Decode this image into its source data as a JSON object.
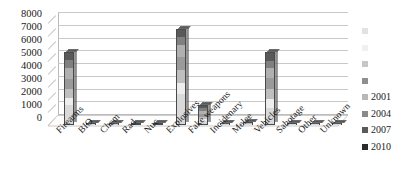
{
  "chart_data": {
    "type": "bar",
    "subtype": "stacked-3d-column",
    "title": "",
    "subtitle": "",
    "xlabel": "",
    "ylabel": "",
    "ylim": [
      0,
      8000
    ],
    "ytick_step": 1000,
    "grid": true,
    "legend_position": "right",
    "ytick_labels": [
      "8000",
      "7000",
      "6000",
      "5000",
      "4000",
      "3000",
      "2000",
      "1000",
      "0"
    ],
    "ytick_values": [
      8000,
      7000,
      6000,
      5000,
      4000,
      3000,
      2000,
      1000,
      0
    ],
    "categories": [
      "Firearms",
      "BIO",
      "Chem",
      "Rad",
      "Nuc",
      "Explosives",
      "Fake weapons",
      "Incidenary",
      "Melee",
      "Vehicles",
      "Sabotage",
      "Other",
      "Unknown"
    ],
    "series": [
      {
        "name": "",
        "color": "#d9d9d9",
        "values": [
          1500,
          10,
          30,
          5,
          5,
          2400,
          250,
          10,
          40,
          1300,
          20,
          15,
          10
        ]
      },
      {
        "name": "",
        "color": "#ededed",
        "values": [
          600,
          5,
          25,
          5,
          5,
          900,
          180,
          10,
          35,
          700,
          15,
          15,
          10
        ]
      },
      {
        "name": "",
        "color": "#bfbfbf",
        "values": [
          700,
          5,
          25,
          5,
          5,
          1000,
          200,
          10,
          35,
          800,
          15,
          15,
          10
        ]
      },
      {
        "name": "",
        "color": "#9a9a9a",
        "values": [
          800,
          5,
          25,
          5,
          5,
          1100,
          250,
          10,
          35,
          900,
          15,
          15,
          10
        ]
      },
      {
        "name": "2001",
        "color": "#b0b0b0",
        "values": [
          900,
          5,
          25,
          5,
          5,
          900,
          250,
          10,
          35,
          800,
          15,
          15,
          10
        ]
      },
      {
        "name": "2004",
        "color": "#808080",
        "values": [
          700,
          5,
          25,
          5,
          5,
          700,
          250,
          10,
          35,
          600,
          15,
          15,
          10
        ]
      },
      {
        "name": "2007",
        "color": "#595959",
        "values": [
          500,
          5,
          20,
          5,
          5,
          500,
          200,
          10,
          35,
          600,
          15,
          15,
          10
        ]
      },
      {
        "name": "2010",
        "color": "#2e2e2e",
        "values": [
          0,
          0,
          0,
          0,
          0,
          0,
          0,
          0,
          0,
          0,
          0,
          0,
          0
        ]
      }
    ],
    "totals": [
      5700,
      40,
      175,
      30,
      30,
      7500,
      1580,
      70,
      250,
      5700,
      110,
      105,
      70
    ]
  },
  "legend": {
    "items": [
      {
        "label": "",
        "color": "#e2e2e2"
      },
      {
        "label": "",
        "color": "#f0f0f0"
      },
      {
        "label": "",
        "color": "#c6c6c6"
      },
      {
        "label": "",
        "color": "#8f8f8f"
      },
      {
        "label": "2001",
        "color": "#b8b8b8"
      },
      {
        "label": "2004",
        "color": "#8a8a8a"
      },
      {
        "label": "2007",
        "color": "#5a5a5a"
      },
      {
        "label": "2010",
        "color": "#2b2b2b"
      }
    ]
  }
}
